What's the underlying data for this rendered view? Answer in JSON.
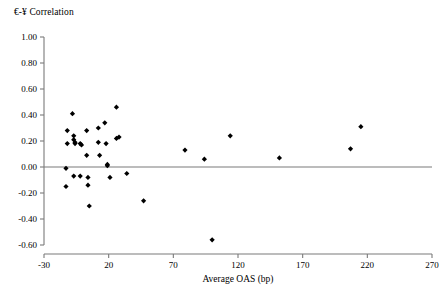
{
  "chart_data": {
    "type": "scatter",
    "title": "€-¥ Correlation",
    "xlabel": "Average OAS (bp)",
    "ylabel": "",
    "xlim": [
      -30,
      270
    ],
    "ylim": [
      -0.6,
      1.0
    ],
    "xticks": [
      -30,
      20,
      70,
      120,
      170,
      220,
      270
    ],
    "xticklabels": [
      "-30",
      "20",
      "70",
      "120",
      "170",
      "220",
      "270"
    ],
    "yticks": [
      -0.6,
      -0.4,
      -0.2,
      0.0,
      0.2,
      0.4,
      0.6,
      0.8,
      1.0
    ],
    "yticklabels": [
      "-0.60",
      "-0.40",
      "-0.20",
      "0.00",
      "0.20",
      "0.40",
      "0.60",
      "0.80",
      "1.00"
    ],
    "grid": false,
    "legend": null,
    "marker": "diamond",
    "marker_color": "#000000",
    "zero_line": true,
    "points": [
      {
        "x": -12,
        "y": 0.28
      },
      {
        "x": -12,
        "y": 0.18
      },
      {
        "x": -13,
        "y": -0.01
      },
      {
        "x": -13,
        "y": -0.15
      },
      {
        "x": -8,
        "y": 0.41
      },
      {
        "x": -7,
        "y": 0.24
      },
      {
        "x": -7,
        "y": 0.21
      },
      {
        "x": -6,
        "y": 0.18
      },
      {
        "x": -6,
        "y": 0.19
      },
      {
        "x": -7,
        "y": -0.07
      },
      {
        "x": -2,
        "y": 0.18
      },
      {
        "x": -1,
        "y": 0.17
      },
      {
        "x": -2,
        "y": -0.07
      },
      {
        "x": 3,
        "y": 0.28
      },
      {
        "x": 3,
        "y": 0.09
      },
      {
        "x": 4,
        "y": -0.08
      },
      {
        "x": 4,
        "y": -0.14
      },
      {
        "x": 5,
        "y": -0.3
      },
      {
        "x": 12,
        "y": 0.3
      },
      {
        "x": 12,
        "y": 0.19
      },
      {
        "x": 13,
        "y": 0.09
      },
      {
        "x": 17,
        "y": 0.34
      },
      {
        "x": 18,
        "y": 0.18
      },
      {
        "x": 19,
        "y": 0.01
      },
      {
        "x": 19,
        "y": 0.02
      },
      {
        "x": 21,
        "y": -0.08
      },
      {
        "x": 26,
        "y": 0.46
      },
      {
        "x": 26,
        "y": 0.22
      },
      {
        "x": 28,
        "y": 0.23
      },
      {
        "x": 34,
        "y": -0.05
      },
      {
        "x": 47,
        "y": -0.26
      },
      {
        "x": 79,
        "y": 0.13
      },
      {
        "x": 94,
        "y": 0.06
      },
      {
        "x": 100,
        "y": -0.56
      },
      {
        "x": 114,
        "y": 0.24
      },
      {
        "x": 152,
        "y": 0.07
      },
      {
        "x": 207,
        "y": 0.14
      },
      {
        "x": 215,
        "y": 0.31
      }
    ]
  }
}
